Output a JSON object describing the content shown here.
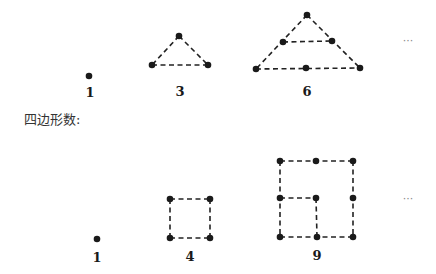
{
  "triangular": {
    "labels": [
      "1",
      "3",
      "6"
    ],
    "ellipsis": "···"
  },
  "square": {
    "title": "四边形数:",
    "labels": [
      "1",
      "4",
      "9"
    ],
    "ellipsis": "···"
  },
  "colors": {
    "dot": "#1a1a1a",
    "edge": "#222222",
    "background": "#ffffff"
  }
}
